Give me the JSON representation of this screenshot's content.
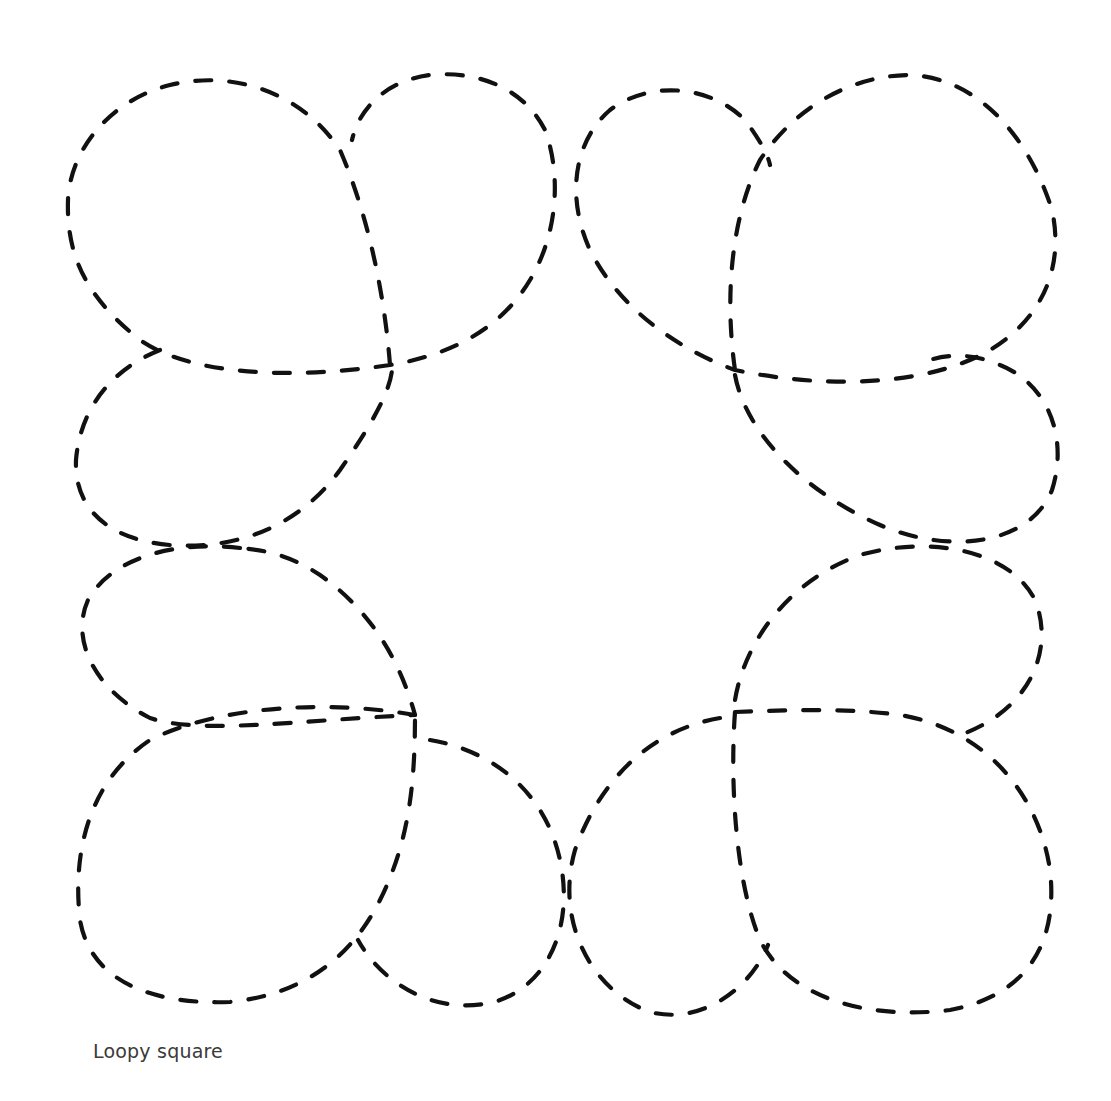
{
  "figure": {
    "caption": "Loopy square",
    "line_style": "dashed",
    "stroke_color": "#111111",
    "background": "#ffffff",
    "loops": [
      {
        "name": "top-left-large",
        "position": "top-left"
      },
      {
        "name": "top-left-small",
        "position": "top-center-left"
      },
      {
        "name": "top-right-small",
        "position": "top-center-right"
      },
      {
        "name": "top-right-large",
        "position": "top-right"
      },
      {
        "name": "right-upper-small",
        "position": "right-upper"
      },
      {
        "name": "right-lower-small",
        "position": "right-lower"
      },
      {
        "name": "bottom-right-large",
        "position": "bottom-right"
      },
      {
        "name": "bottom-right-small",
        "position": "bottom-center-right"
      },
      {
        "name": "bottom-left-small",
        "position": "bottom-center-left"
      },
      {
        "name": "bottom-left-large",
        "position": "bottom-left"
      },
      {
        "name": "left-lower-small",
        "position": "left-lower"
      },
      {
        "name": "left-upper-small",
        "position": "left-upper"
      }
    ]
  }
}
